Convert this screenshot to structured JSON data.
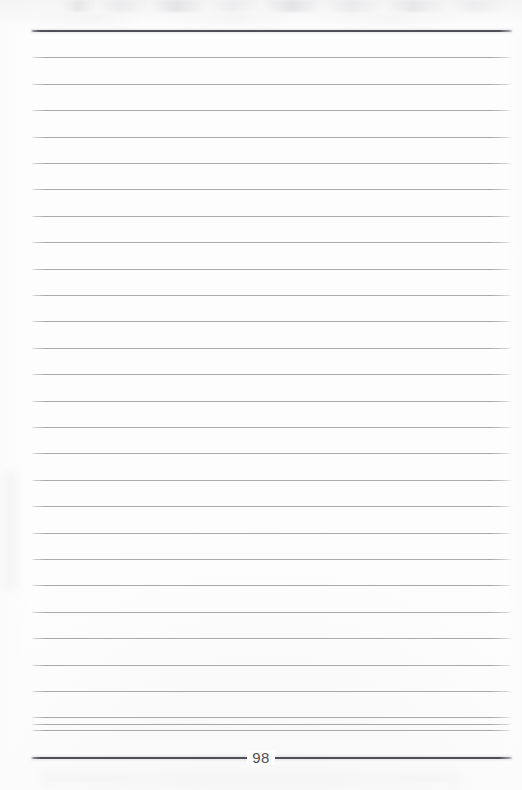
{
  "page": {
    "kind": "scanned-lined-notebook-page",
    "width": 522,
    "height": 790,
    "background_color": "#fdfdfd",
    "folio_number": "98"
  },
  "ruling": {
    "rule_color": "#a9a9ad",
    "heavy_rule_color": "#4a4a52",
    "left_x": 31,
    "right_x": 512,
    "line_spacing": 26.4,
    "thin_line_count": 28,
    "heavy_rule_y": [
      31,
      758
    ],
    "thin_rule_y": [
      57.4,
      83.8,
      110.2,
      136.6,
      163.0,
      189.4,
      215.8,
      242.2,
      268.6,
      295.0,
      321.4,
      347.8,
      374.2,
      400.6,
      427.0,
      453.4,
      479.8,
      506.2,
      532.6,
      559.0,
      585.4,
      611.8,
      638.2,
      664.6,
      691.0,
      717.4,
      723.8,
      730.0
    ]
  },
  "artifacts": {
    "top_smudge_label": "scanner-smudge-band",
    "margin_smudge_label": "paper-margin-shading"
  }
}
